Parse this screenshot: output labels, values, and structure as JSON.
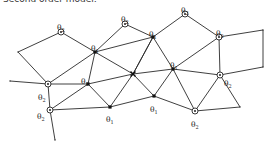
{
  "title": "Second order model:",
  "legend": {
    "theta1_symbol": "θ",
    "theta1_sub": "1",
    "theta2_symbol": "θ",
    "theta2_sub": "2"
  },
  "nodes": [
    {
      "id": "n1",
      "x": 61,
      "y": 32,
      "type": "ring",
      "label": "θ2",
      "lx": 57,
      "ly": 24
    },
    {
      "id": "n2",
      "x": 125,
      "y": 24,
      "type": "ring",
      "label": "θ2",
      "lx": 121,
      "ly": 16
    },
    {
      "id": "n3",
      "x": 185,
      "y": 14,
      "type": "ring",
      "label": "θ2",
      "lx": 181,
      "ly": 7
    },
    {
      "id": "n4",
      "x": 95,
      "y": 52,
      "type": "dot",
      "label": "θ1",
      "lx": 91,
      "ly": 45
    },
    {
      "id": "n5",
      "x": 153,
      "y": 37,
      "type": "dot",
      "label": "θ1",
      "lx": 149,
      "ly": 31
    },
    {
      "id": "n6",
      "x": 219,
      "y": 37,
      "type": "ring",
      "label": "θ2",
      "lx": 216,
      "ly": 30
    },
    {
      "id": "n7",
      "x": 48,
      "y": 84,
      "type": "ring",
      "label": "θ2",
      "lx": 38,
      "ly": 94
    },
    {
      "id": "n8",
      "x": 88,
      "y": 84,
      "type": "dot",
      "label": "θ1",
      "lx": 81,
      "ly": 78
    },
    {
      "id": "n9",
      "x": 133,
      "y": 74,
      "type": "cross",
      "label": ""
    },
    {
      "id": "n10",
      "x": 173,
      "y": 69,
      "type": "dot",
      "label": "θ1",
      "lx": 170,
      "ly": 62
    },
    {
      "id": "n11",
      "x": 220,
      "y": 75,
      "type": "ring",
      "label": "θ2",
      "lx": 224,
      "ly": 80
    },
    {
      "id": "n12",
      "x": 50,
      "y": 110,
      "type": "ring",
      "label": "θ2",
      "lx": 37,
      "ly": 113
    },
    {
      "id": "n13",
      "x": 110,
      "y": 107,
      "type": "dot",
      "label": "θ1",
      "lx": 106,
      "ly": 116
    },
    {
      "id": "n14",
      "x": 154,
      "y": 96,
      "type": "dot",
      "label": "θ1",
      "lx": 150,
      "ly": 106
    },
    {
      "id": "n15",
      "x": 195,
      "y": 111,
      "type": "ring",
      "label": "θ2",
      "lx": 191,
      "ly": 121
    },
    {
      "id": "e1",
      "x": 18,
      "y": 52,
      "type": "end",
      "label": ""
    },
    {
      "id": "e2",
      "x": 10,
      "y": 81,
      "type": "end",
      "label": ""
    },
    {
      "id": "e3",
      "x": 55,
      "y": 140,
      "type": "end",
      "label": ""
    },
    {
      "id": "e4",
      "x": 263,
      "y": 30,
      "type": "end",
      "label": ""
    },
    {
      "id": "e5",
      "x": 263,
      "y": 67,
      "type": "end",
      "label": ""
    },
    {
      "id": "e6",
      "x": 240,
      "y": 107,
      "type": "end",
      "label": ""
    }
  ],
  "edges": [
    [
      "e1",
      "n1"
    ],
    [
      "e1",
      "n7"
    ],
    [
      "n1",
      "n4"
    ],
    [
      "n4",
      "n2"
    ],
    [
      "n2",
      "n5"
    ],
    [
      "n4",
      "n5"
    ],
    [
      "n5",
      "n3"
    ],
    [
      "n3",
      "n6"
    ],
    [
      "n5",
      "n10"
    ],
    [
      "n6",
      "n10"
    ],
    [
      "n6",
      "e4"
    ],
    [
      "e4",
      "e5"
    ],
    [
      "e5",
      "n11"
    ],
    [
      "n6",
      "n11"
    ],
    [
      "n10",
      "n11"
    ],
    [
      "n11",
      "e6"
    ],
    [
      "n11",
      "n15"
    ],
    [
      "n15",
      "e6"
    ],
    [
      "n10",
      "n15"
    ],
    [
      "n10",
      "n14"
    ],
    [
      "n14",
      "n15"
    ],
    [
      "n9",
      "n4"
    ],
    [
      "n9",
      "n5"
    ],
    [
      "n9",
      "n10"
    ],
    [
      "n9",
      "n8"
    ],
    [
      "n9",
      "n14"
    ],
    [
      "n9",
      "n13"
    ],
    [
      "n4",
      "n7"
    ],
    [
      "n4",
      "n8"
    ],
    [
      "e2",
      "n7"
    ],
    [
      "n7",
      "n8"
    ],
    [
      "n7",
      "n12"
    ],
    [
      "n8",
      "n12"
    ],
    [
      "n8",
      "n13"
    ],
    [
      "n12",
      "n13"
    ],
    [
      "n13",
      "n14"
    ],
    [
      "n12",
      "e3"
    ],
    [
      "n5",
      "n9"
    ]
  ]
}
